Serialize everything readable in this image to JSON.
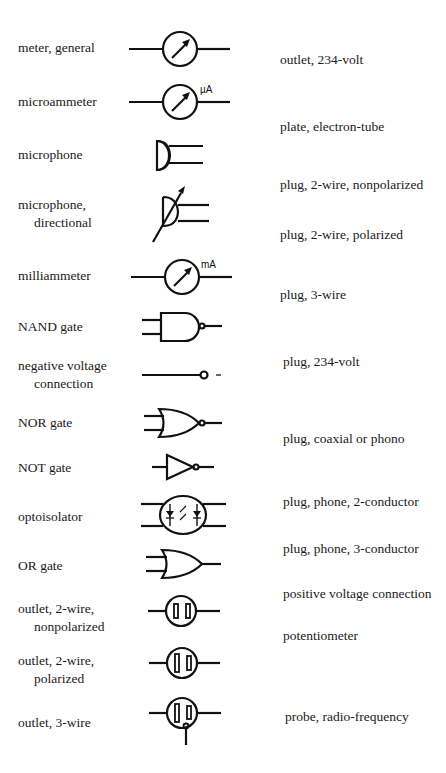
{
  "left_column": [
    {
      "id": "meter-general",
      "line1": "meter, general",
      "line2": ""
    },
    {
      "id": "microammeter",
      "line1": "microammeter",
      "line2": "",
      "unit": "µA"
    },
    {
      "id": "microphone",
      "line1": "microphone",
      "line2": ""
    },
    {
      "id": "microphone-directional",
      "line1": "microphone,",
      "line2": "directional"
    },
    {
      "id": "milliammeter",
      "line1": "milliammeter",
      "line2": "",
      "unit": "mA"
    },
    {
      "id": "nand-gate",
      "line1": "NAND gate",
      "line2": ""
    },
    {
      "id": "negative-voltage-connection",
      "line1": "negative voltage",
      "line2": "connection",
      "sign": "–"
    },
    {
      "id": "nor-gate",
      "line1": "NOR gate",
      "line2": ""
    },
    {
      "id": "not-gate",
      "line1": "NOT gate",
      "line2": ""
    },
    {
      "id": "optoisolator",
      "line1": "optoisolator",
      "line2": ""
    },
    {
      "id": "or-gate",
      "line1": "OR gate",
      "line2": ""
    },
    {
      "id": "outlet-2wire-nonpolarized",
      "line1": "outlet, 2-wire,",
      "line2": "nonpolarized"
    },
    {
      "id": "outlet-2wire-polarized",
      "line1": "outlet, 2-wire,",
      "line2": "polarized"
    },
    {
      "id": "outlet-3wire",
      "line1": "outlet, 3-wire",
      "line2": ""
    }
  ],
  "right_column": [
    {
      "label": "outlet, 234-volt"
    },
    {
      "label": "plate, electron-tube"
    },
    {
      "label": "plug, 2-wire, nonpolarized"
    },
    {
      "label": "plug, 2-wire, polarized"
    },
    {
      "label": "plug, 3-wire"
    },
    {
      "label": "plug, 234-volt"
    },
    {
      "label": "plug, coaxial or phono"
    },
    {
      "label": "plug, phone, 2-conductor"
    },
    {
      "label": "plug, phone, 3-conductor"
    },
    {
      "label": "positive voltage connection"
    },
    {
      "label": "potentiometer"
    },
    {
      "label": "probe, radio-frequency"
    }
  ]
}
